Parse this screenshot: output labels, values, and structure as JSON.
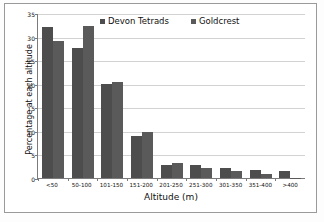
{
  "chart_data": {
    "type": "bar",
    "title": "",
    "xlabel": "Altitude (m)",
    "ylabel": "Percentage at each altitude",
    "categories": [
      "<50",
      "50-100",
      "101-150",
      "151-200",
      "201-250",
      "251-300",
      "301-350",
      "351-400",
      ">400"
    ],
    "series": [
      {
        "name": "Devon Tetrads",
        "color": "#4d4d4d",
        "values": [
          32.0,
          27.6,
          19.9,
          8.9,
          2.8,
          2.8,
          2.1,
          1.7,
          1.5
        ]
      },
      {
        "name": "Goldcrest",
        "color": "#5a5a5a",
        "values": [
          29.0,
          32.2,
          20.3,
          9.7,
          3.2,
          2.2,
          1.4,
          0.9,
          0.05
        ]
      }
    ],
    "ylim": [
      0,
      35
    ],
    "yticks": [
      0,
      5,
      10,
      15,
      20,
      25,
      30,
      35
    ],
    "ytick_labels": [
      "0",
      "5",
      "10",
      "15",
      "20",
      "25",
      "30",
      "35"
    ],
    "grid": true,
    "grid_axis": "y",
    "legend_position": "top-center"
  }
}
